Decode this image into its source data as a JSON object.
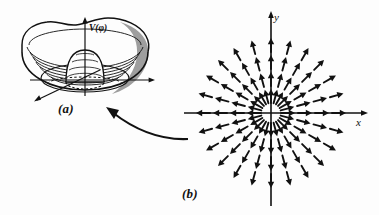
{
  "figure": {
    "background_color": "#fdfdfd",
    "ink_color": "#111111",
    "shade_color": "#8d8d8d"
  },
  "panel_a": {
    "caption": "(a)",
    "name": "mexican-hat-potential",
    "potential_label": "V(φ)",
    "description": "Sombrero / Mexican-hat potential surface with central bump and circular valley",
    "axes": [
      {
        "name": "vertical-axis",
        "label": "V(φ)",
        "direction": "up"
      },
      {
        "name": "horizontal-axis",
        "label": "",
        "direction": "right"
      },
      {
        "name": "depth-axis",
        "label": "",
        "direction": "down-left"
      }
    ],
    "contour_ring_count": 7,
    "dome_contour_count": 4,
    "vacuum_circle": "dashed",
    "shaded_wall": true
  },
  "panel_b": {
    "caption": "(b)",
    "name": "radial-vector-field",
    "description": "Radially outward arrows from the origin",
    "axis_x_label": "x",
    "axis_y_label": "y",
    "spoke_count": 24,
    "ring_count": 4,
    "arrow_direction": "outward"
  },
  "connector": {
    "name": "curved-arrow",
    "from": "(b)",
    "to": "(a)",
    "style": "curved-arrow-pointing-up-left"
  },
  "chart_data": {
    "type": "scatter",
    "xlabel": "x",
    "ylabel": "y",
    "spokes_deg": [
      0,
      15,
      30,
      45,
      60,
      75,
      90,
      105,
      120,
      135,
      150,
      165,
      180,
      195,
      210,
      225,
      240,
      255,
      270,
      285,
      300,
      315,
      330,
      345
    ],
    "ring_radii": [
      17,
      34,
      51,
      68
    ],
    "vector_rule": "v = r_hat (points radially outward, magnitude constant)"
  }
}
